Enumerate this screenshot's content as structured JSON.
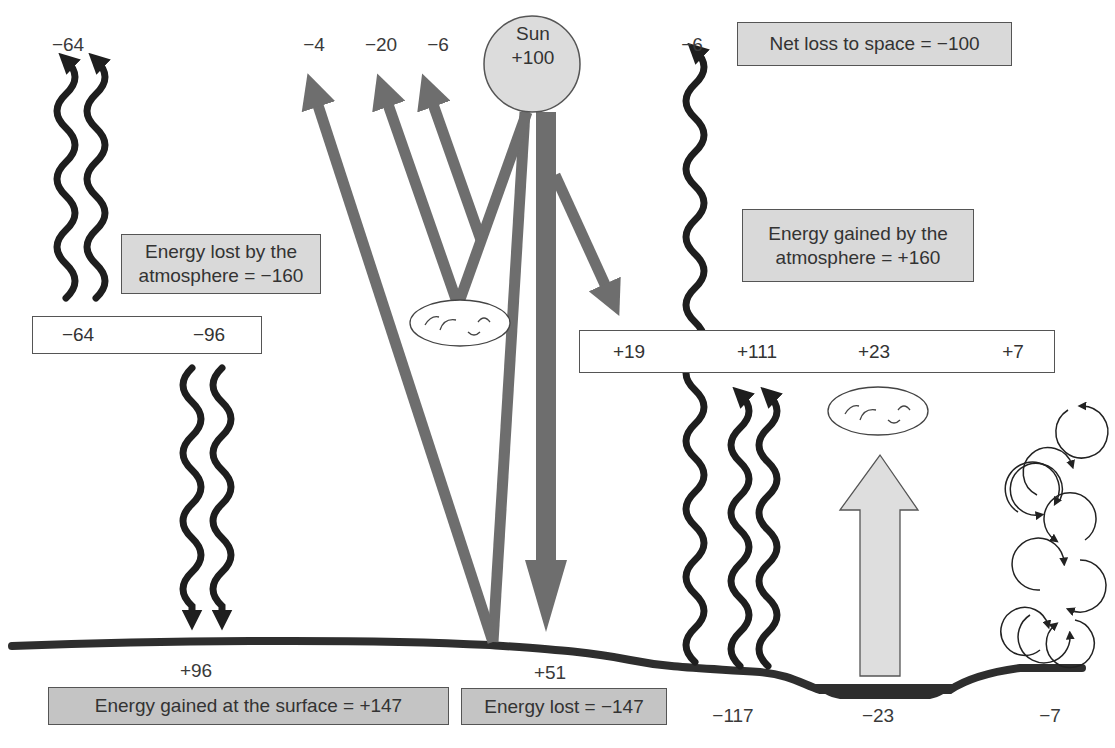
{
  "sun": {
    "label": "Sun",
    "value": "+100"
  },
  "top_labels": {
    "lw_atmosphere_to_space": "−64",
    "sw_surface_reflect": "−4",
    "sw_cloud_reflect": "−20",
    "sw_atmosphere_scatter": "−6",
    "lw_surface_to_space": "−6"
  },
  "boxes": {
    "net_loss": "Net loss to space = −100",
    "atmosphere_lost_line1": "Energy lost by the",
    "atmosphere_lost_line2": "atmosphere = −160",
    "atmosphere_gained_line1": "Energy gained by the",
    "atmosphere_gained_line2": "atmosphere = +160",
    "surface_gained": "Energy gained at the surface = +147",
    "surface_lost": "Energy lost = −147"
  },
  "atmosphere_loss_row": {
    "to_space": "−64",
    "to_surface": "−96"
  },
  "atmosphere_gain_row": {
    "solar_absorbed": "+19",
    "longwave": "+111",
    "latent_heat": "+23",
    "sensible_heat": "+7"
  },
  "surface_labels": {
    "back_radiation": "+96",
    "solar_absorbed": "+51",
    "longwave_emitted": "−117",
    "latent_heat": "−23",
    "sensible_heat": "−7"
  },
  "colors": {
    "shortwave": "#6e6e6e",
    "longwave": "#1e1e1e",
    "box_fill": "#d9d9d9",
    "sun_fill": "#dcdcdc",
    "ground": "#2e2e2e",
    "latent_arrow": "#dedede"
  }
}
